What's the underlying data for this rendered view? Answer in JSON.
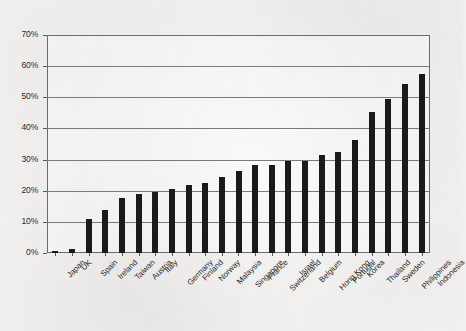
{
  "chart_data": {
    "type": "bar",
    "title": "",
    "subtitle": "",
    "xlabel": "",
    "ylabel": "",
    "ylim": [
      0,
      70
    ],
    "yunit": "%",
    "ytick_labels": [
      "0%",
      "10%",
      "20%",
      "30%",
      "40%",
      "50%",
      "60%",
      "70%"
    ],
    "ytick_values": [
      0,
      10,
      20,
      30,
      40,
      50,
      60,
      70
    ],
    "grid": true,
    "legend": "none",
    "bar_color": "#1a1a1a",
    "categories": [
      "Japan",
      "UK",
      "Spain",
      "Ireland",
      "Taiwan",
      "Austria",
      "Italy",
      "Germany",
      "Finland",
      "Norway",
      "Malaysia",
      "Singapore",
      "France",
      "Switzerland",
      "Israel",
      "Belgium",
      "Hong Kong",
      "Portugal",
      "Korea",
      "Thailand",
      "Sweden",
      "Philippines",
      "Indonesia"
    ],
    "values": [
      0.5,
      1.2,
      10.8,
      13.7,
      17.8,
      18.8,
      19.6,
      20.7,
      21.7,
      22.6,
      24.4,
      26.4,
      28.3,
      28.4,
      29.4,
      29.4,
      31.5,
      32.3,
      36.3,
      45.3,
      49.3,
      54.3,
      57.4
    ]
  }
}
